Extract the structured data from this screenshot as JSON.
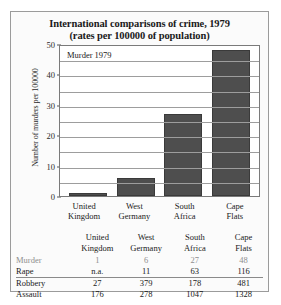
{
  "figure": {
    "title_line1": "International comparisons of crime, 1979",
    "title_line2": "(rates per 100000 of population)"
  },
  "chart_data": {
    "type": "bar",
    "title": "International comparisons of crime, 1979 (rates per 100000 of population)",
    "series_label": "Murder 1979",
    "xlabel": "",
    "ylabel": "Number of murders per 100000",
    "categories": [
      "United Kingdom",
      "West Germany",
      "South Africa",
      "Cape Flats"
    ],
    "category_lines": [
      [
        "United",
        "Kingdom"
      ],
      [
        "West",
        "Germany"
      ],
      [
        "South",
        "Africa"
      ],
      [
        "Cape",
        "Flats"
      ]
    ],
    "values": [
      1,
      6,
      27,
      48
    ],
    "ylim": [
      0,
      50
    ],
    "ytick_labels": [
      "0",
      "10",
      "20",
      "30",
      "40",
      "50"
    ],
    "yticks": [
      0,
      10,
      20,
      30,
      40,
      50
    ],
    "gridline_interval": 5,
    "grid": true,
    "legend_position": "inside-top-left",
    "bar_color": "#4e4e4e",
    "plot_background": "#ffffff",
    "table": {
      "columns": [
        "United Kingdom",
        "West Germany",
        "South Africa",
        "Cape Flats"
      ],
      "rows": [
        {
          "label": "Murder",
          "dim": true,
          "values": [
            "1",
            "6",
            "27",
            "48"
          ]
        },
        {
          "label": "Rape",
          "dim": false,
          "values": [
            "n.a.",
            "11",
            "63",
            "116"
          ]
        },
        {
          "label": "Robbery",
          "dim": false,
          "values": [
            "27",
            "379",
            "178",
            "481"
          ]
        },
        {
          "label": "Assault",
          "dim": false,
          "values": [
            "176",
            "278",
            "1047",
            "1328"
          ]
        }
      ]
    }
  }
}
